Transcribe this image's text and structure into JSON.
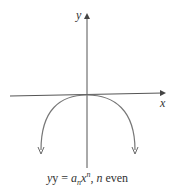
{
  "diagram": {
    "axes": {
      "x_label": "x",
      "y_label": "y"
    },
    "curve": {
      "shape": "downward-opening even-degree polynomial end behavior",
      "vertex": "origin"
    },
    "caption": {
      "prefix": "y = ",
      "coef": "a",
      "coef_sub": "n",
      "var": "x",
      "var_sup": "n",
      "suffix_sep": ", ",
      "n_var": "n",
      "suffix": " even"
    },
    "colors": {
      "line": "#555555",
      "curve": "#666666"
    }
  }
}
